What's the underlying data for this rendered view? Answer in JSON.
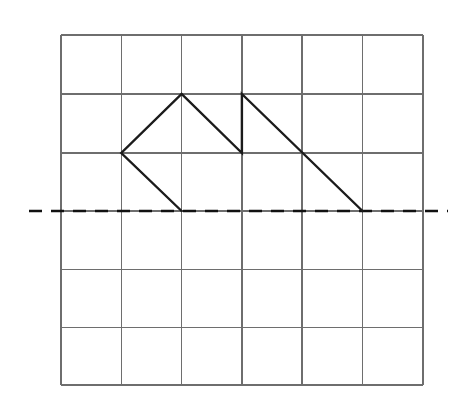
{
  "page": {
    "background_color": "#ffffff",
    "width": 464,
    "height": 407
  },
  "grid": {
    "label": "Square grid",
    "left": 61,
    "top": 35,
    "right": 423,
    "bottom": 385,
    "columns": 6,
    "rows": 6,
    "cell_width": 60.3,
    "cell_height": 58.3,
    "line_color": "#6e6e6e",
    "border_color": "#6e6e6e",
    "vertical_lines_x": [
      61,
      121.3,
      181.6,
      241.9,
      302.2,
      362.5,
      423
    ],
    "horizontal_lines_y": [
      35,
      94,
      153,
      211,
      269.5,
      327.5,
      385
    ]
  },
  "mirror_line": {
    "label": "Line of reflection",
    "orientation": "horizontal",
    "y": 211,
    "x_start": 29,
    "x_end": 448,
    "style": "dashed",
    "color": "#111111",
    "dash_pattern": "13 9"
  },
  "shape": {
    "label": "Polygonal figure above the mirror line",
    "stroke_color": "#1b1b1b",
    "stroke_width": 2.4,
    "closed": false,
    "vertices": [
      {
        "name": "bottom-left-vertex",
        "x": 181.6,
        "y": 211,
        "grid_col": 2,
        "grid_row": 3
      },
      {
        "name": "left-vertex",
        "x": 121.3,
        "y": 153,
        "grid_col": 1,
        "grid_row": 2
      },
      {
        "name": "first-peak-vertex",
        "x": 181.6,
        "y": 94,
        "grid_col": 2,
        "grid_row": 1
      },
      {
        "name": "notch-vertex",
        "x": 241.9,
        "y": 153,
        "grid_col": 3,
        "grid_row": 2
      },
      {
        "name": "second-peak-vertex",
        "x": 241.9,
        "y": 94,
        "grid_col": 3,
        "grid_row": 1
      },
      {
        "name": "bottom-right-vertex",
        "x": 362.5,
        "y": 211,
        "grid_col": 5,
        "grid_row": 3
      }
    ],
    "edges": [
      {
        "name": "edge-bottom-left-to-left",
        "from": "bottom-left-vertex",
        "to": "left-vertex"
      },
      {
        "name": "edge-left-to-first-peak",
        "from": "left-vertex",
        "to": "first-peak-vertex"
      },
      {
        "name": "edge-first-peak-to-notch",
        "from": "first-peak-vertex",
        "to": "notch-vertex"
      },
      {
        "name": "edge-notch-to-second-peak",
        "from": "notch-vertex",
        "to": "second-peak-vertex"
      },
      {
        "name": "edge-second-peak-to-bottom-right",
        "from": "second-peak-vertex",
        "to": "bottom-right-vertex"
      }
    ],
    "path": "M 181.6 211 L 121.3 153 L 181.6 94 L 241.9 153 L 241.9 94 L 362.5 211"
  }
}
